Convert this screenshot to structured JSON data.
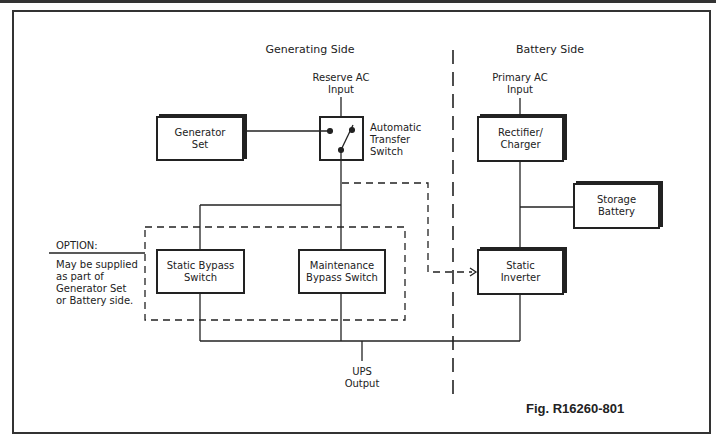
{
  "diagram": {
    "figure_label": "Fig. R16260-801",
    "sections": {
      "generating_side": "Generating Side",
      "battery_side": "Battery Side"
    },
    "inputs": {
      "reserve_ac": "Reserve AC\nInput",
      "primary_ac": "Primary AC\nInput"
    },
    "output": "UPS\nOutput",
    "blocks": {
      "generator_set": "Generator\nSet",
      "automatic_transfer_switch": "Automatic\nTransfer\nSwitch",
      "rectifier_charger": "Rectifier/\nCharger",
      "storage_battery": "Storage\nBattery",
      "static_bypass_switch": "Static Bypass\nSwitch",
      "maintenance_bypass_switch": "Maintenance\nBypass Switch",
      "static_inverter": "Static\nInverter"
    },
    "option_note": {
      "title": "OPTION:",
      "text": "May be supplied\nas part of\nGenerator Set\nor Battery side."
    },
    "colors": {
      "line": "#222222",
      "background": "#ffffff"
    }
  }
}
